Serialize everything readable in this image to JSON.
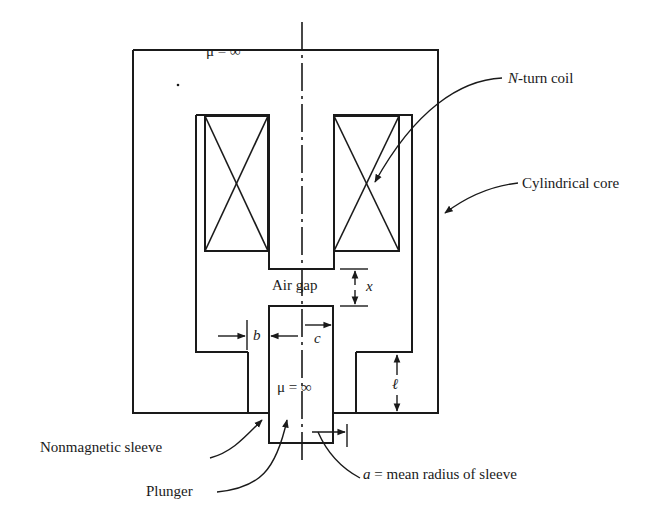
{
  "diagram": {
    "type": "plunger-solenoid cross-section",
    "labels": {
      "core_permeability": "μ = ∞",
      "plunger_permeability": "μ = ∞",
      "coil": {
        "var": "N",
        "text": "-turn coil"
      },
      "core": "Cylindrical core",
      "air_gap": "Air gap",
      "gap_dim": "x",
      "b_dim": "b",
      "c_dim": "c",
      "l_dim": "ℓ",
      "sleeve": "Nonmagnetic sleeve",
      "plunger": "Plunger",
      "radius": {
        "var": "a",
        "text": " = mean radius of sleeve"
      }
    },
    "colors": {
      "line": "#1a1a1a",
      "background": "#ffffff"
    }
  }
}
